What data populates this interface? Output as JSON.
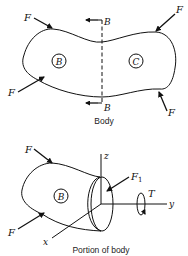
{
  "figure": {
    "top": {
      "caption": "Body",
      "section_label_top": "B",
      "section_label_bottom": "B",
      "region_left": "B",
      "region_right": "C",
      "forces": [
        "F",
        "F",
        "F",
        "F"
      ]
    },
    "bottom": {
      "caption": "Portion of body",
      "region": "B",
      "forces": [
        "F",
        "F"
      ],
      "internal_force": "F",
      "internal_force_sub": "1",
      "torque": "T",
      "axes": {
        "x": "x",
        "y": "y",
        "z": "z"
      }
    }
  }
}
